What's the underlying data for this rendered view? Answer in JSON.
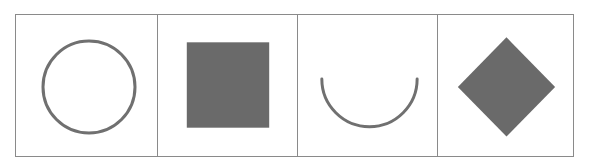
{
  "figure": {
    "panels": [
      {
        "shape": "circle",
        "style": "outline",
        "stroke": "#707070"
      },
      {
        "shape": "square",
        "style": "filled",
        "fill": "#6a6a6a"
      },
      {
        "shape": "semicircle-arc",
        "style": "outline",
        "orientation": "open-up",
        "stroke": "#707070"
      },
      {
        "shape": "diamond",
        "style": "filled",
        "fill": "#6a6a6a"
      }
    ],
    "border_color": "#8a8a8a"
  }
}
